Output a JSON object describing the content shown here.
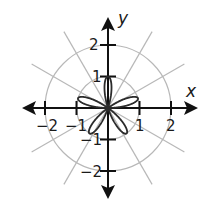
{
  "chart_data": {
    "type": "polar-curve",
    "equation": "r = sin(5θ)",
    "petals": 5,
    "petal_length": 1,
    "petal_angles_deg": [
      18,
      90,
      162,
      234,
      306
    ],
    "axes": {
      "x_label": "x",
      "y_label": "y",
      "x_ticks": [
        -2,
        -1,
        1,
        2
      ],
      "y_ticks": [
        -2,
        -1,
        1,
        2
      ],
      "x_tick_labels": [
        "−2",
        "−1",
        "1",
        "2"
      ],
      "y_tick_labels": [
        "−2",
        "−1",
        "1",
        "2"
      ],
      "range": [
        -2.8,
        2.8
      ]
    },
    "grid": {
      "circles_r": [
        1,
        2
      ],
      "radial_lines_deg": [
        30,
        60,
        120,
        150
      ]
    }
  },
  "labels": {
    "x": "x",
    "y": "y",
    "xm2": "−2",
    "xm1": "−1",
    "x1": "1",
    "x2": "2",
    "y2": "2",
    "y1": "1",
    "ym1": "−1",
    "ym2": "−2"
  },
  "colors": {
    "curve": "#2b2b2b",
    "axes": "#111111",
    "grid": "#b8b8b8"
  }
}
